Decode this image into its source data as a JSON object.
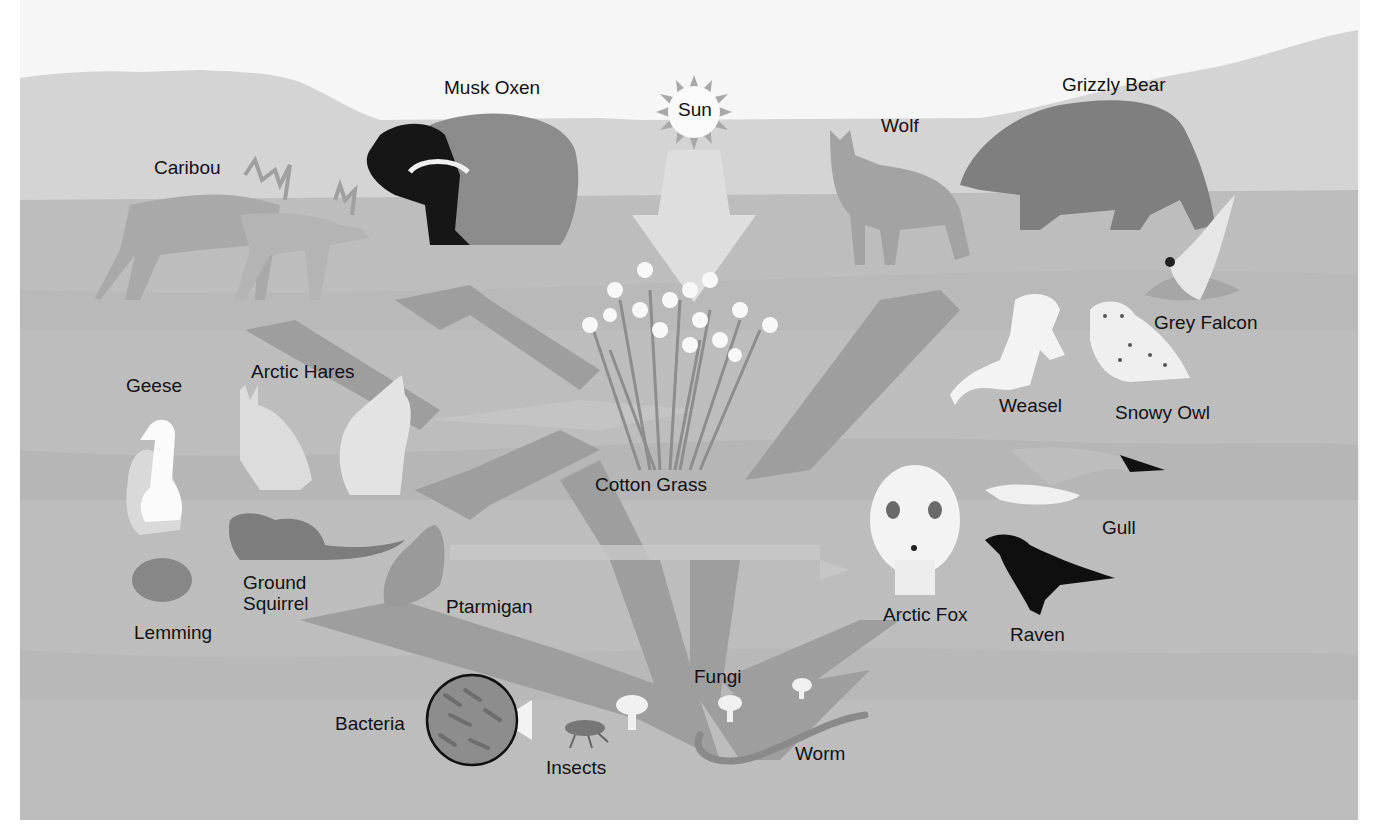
{
  "diagram": {
    "type": "food-web",
    "colors": {
      "sky": "#f7f7f7",
      "far_hill": "#d6d6d6",
      "ground": "#bdbdbd",
      "ground_band": "#b2b2b2",
      "arrow_light": "#c9c9c9",
      "arrow_dark": "#9a9a9a",
      "text": "#111111"
    },
    "energy_source": {
      "label": "Sun"
    },
    "producers": [
      {
        "label": "Cotton Grass"
      }
    ],
    "herbivores": [
      {
        "label": "Caribou"
      },
      {
        "label": "Musk Oxen"
      },
      {
        "label": "Geese"
      },
      {
        "label": "Arctic Hares"
      },
      {
        "label": "Lemming"
      },
      {
        "label": "Ground Squirrel"
      },
      {
        "label": "Ptarmigan"
      }
    ],
    "carnivores": [
      {
        "label": "Wolf"
      },
      {
        "label": "Grizzly Bear"
      },
      {
        "label": "Grey Falcon"
      },
      {
        "label": "Weasel"
      },
      {
        "label": "Snowy Owl"
      },
      {
        "label": "Gull"
      },
      {
        "label": "Arctic Fox"
      },
      {
        "label": "Raven"
      }
    ],
    "decomposers": [
      {
        "label": "Fungi"
      },
      {
        "label": "Bacteria"
      },
      {
        "label": "Insects"
      },
      {
        "label": "Worm"
      }
    ]
  }
}
